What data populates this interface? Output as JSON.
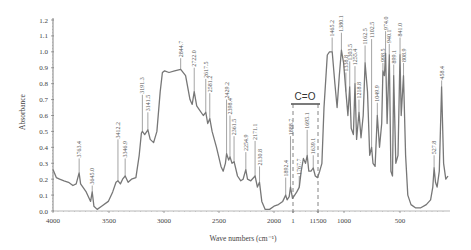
{
  "chart_data": {
    "type": "line",
    "title": "",
    "xlabel": "Wave numbers (cm⁻¹)",
    "ylabel": "Absorbance",
    "xlim": [
      4000,
      400
    ],
    "ylim": [
      0.0,
      1.2
    ],
    "grid": false,
    "legend": null,
    "x_tick_labels": [
      "4000",
      "3500",
      "3000",
      "2500",
      "2000",
      "1",
      "11500",
      "1000",
      "500"
    ],
    "y_tick_labels": [
      "0.0",
      "0.1",
      "0.2",
      "0.3",
      "0.4",
      "0.5",
      "0.6",
      "0.7",
      "0.8",
      "0.9",
      "1.0",
      "1.1",
      "1.2"
    ],
    "annotation": {
      "text": "C=O",
      "range": [
        1888.7,
        1560
      ],
      "style": "dashed bracket"
    },
    "series": [
      {
        "name": "Absorbance spectrum",
        "color": "#777777",
        "points": [
          [
            4000,
            0.26
          ],
          [
            3970,
            0.21
          ],
          [
            3940,
            0.2
          ],
          [
            3900,
            0.19
          ],
          [
            3860,
            0.18
          ],
          [
            3820,
            0.16
          ],
          [
            3790,
            0.17
          ],
          [
            3763.4,
            0.24
          ],
          [
            3750,
            0.17
          ],
          [
            3700,
            0.12
          ],
          [
            3660,
            0.06
          ],
          [
            3645.0,
            0.12
          ],
          [
            3630,
            0.03
          ],
          [
            3600,
            0.01
          ],
          [
            3560,
            0.03
          ],
          [
            3500,
            0.06
          ],
          [
            3460,
            0.12
          ],
          [
            3430,
            0.18
          ],
          [
            3412.2,
            0.19
          ],
          [
            3390,
            0.17
          ],
          [
            3370,
            0.2
          ],
          [
            3346.9,
            0.22
          ],
          [
            3320,
            0.18
          ],
          [
            3290,
            0.2
          ],
          [
            3250,
            0.21
          ],
          [
            3220,
            0.35
          ],
          [
            3200,
            0.49
          ],
          [
            3191.3,
            0.5
          ],
          [
            3170,
            0.48
          ],
          [
            3141.5,
            0.51
          ],
          [
            3120,
            0.45
          ],
          [
            3090,
            0.43
          ],
          [
            3060,
            0.5
          ],
          [
            3030,
            0.75
          ],
          [
            3010,
            0.87
          ],
          [
            2990,
            0.88
          ],
          [
            2950,
            0.87
          ],
          [
            2900,
            0.88
          ],
          [
            2844.7,
            0.89
          ],
          [
            2800,
            0.85
          ],
          [
            2760,
            0.7
          ],
          [
            2740,
            0.67
          ],
          [
            2722.0,
            0.75
          ],
          [
            2700,
            0.66
          ],
          [
            2680,
            0.64
          ],
          [
            2640,
            0.6
          ],
          [
            2617.5,
            0.62
          ],
          [
            2600,
            0.55
          ],
          [
            2581.2,
            0.58
          ],
          [
            2560,
            0.5
          ],
          [
            2520,
            0.4
          ],
          [
            2480,
            0.28
          ],
          [
            2460,
            0.25
          ],
          [
            2440,
            0.3
          ],
          [
            2429.2,
            0.36
          ],
          [
            2410,
            0.32
          ],
          [
            2398.4,
            0.34
          ],
          [
            2380,
            0.3
          ],
          [
            2361.5,
            0.31
          ],
          [
            2330,
            0.22
          ],
          [
            2300,
            0.19
          ],
          [
            2280,
            0.2
          ],
          [
            2254.9,
            0.26
          ],
          [
            2240,
            0.2
          ],
          [
            2210,
            0.19
          ],
          [
            2171.1,
            0.22
          ],
          [
            2150,
            0.15
          ],
          [
            2130.8,
            0.18
          ],
          [
            2110,
            0.06
          ],
          [
            2080,
            0.01
          ],
          [
            2040,
            0.01
          ],
          [
            2000,
            0.03
          ],
          [
            1960,
            0.04
          ],
          [
            1920,
            0.06
          ],
          [
            1892.4,
            0.1
          ],
          [
            1880,
            0.07
          ],
          [
            1860,
            0.09
          ],
          [
            1848.3,
            0.15
          ],
          [
            1830,
            0.08
          ],
          [
            1810,
            0.1
          ],
          [
            1790,
            0.12
          ],
          [
            1767.7,
            0.15
          ],
          [
            1750,
            0.25
          ],
          [
            1730,
            0.33
          ],
          [
            1710,
            0.3
          ],
          [
            1695.1,
            0.35
          ],
          [
            1680,
            0.25
          ],
          [
            1660,
            0.25
          ],
          [
            1639.1,
            0.27
          ],
          [
            1620,
            0.22
          ],
          [
            1600,
            0.21
          ],
          [
            1580,
            0.25
          ],
          [
            1560,
            0.3
          ],
          [
            1540,
            0.65
          ],
          [
            1510,
            0.98
          ],
          [
            1490,
            1.0
          ],
          [
            1465.2,
            1.0
          ],
          [
            1440,
            0.8
          ],
          [
            1420,
            0.65
          ],
          [
            1400,
            0.85
          ],
          [
            1380.1,
            1.01
          ],
          [
            1360,
            0.93
          ],
          [
            1338.8,
            0.75
          ],
          [
            1320,
            0.6
          ],
          [
            1303.5,
            0.78
          ],
          [
            1290,
            0.52
          ],
          [
            1270,
            0.48
          ],
          [
            1255.4,
            0.8
          ],
          [
            1240,
            0.45
          ],
          [
            1218.8,
            0.62
          ],
          [
            1200,
            0.46
          ],
          [
            1180,
            0.6
          ],
          [
            1162.5,
            0.93
          ],
          [
            1140,
            0.75
          ],
          [
            1120,
            0.35
          ],
          [
            1102.5,
            0.4
          ],
          [
            1090,
            0.3
          ],
          [
            1070,
            0.28
          ],
          [
            1049.9,
            0.6
          ],
          [
            1030,
            0.4
          ],
          [
            1010,
            0.55
          ],
          [
            998.5,
            0.88
          ],
          [
            985,
            0.85
          ],
          [
            974.0,
            0.99
          ],
          [
            960,
            0.55
          ],
          [
            940.1,
            0.98
          ],
          [
            925,
            0.25
          ],
          [
            910,
            0.22
          ],
          [
            899.1,
            0.85
          ],
          [
            880,
            0.3
          ],
          [
            860,
            0.35
          ],
          [
            841.0,
            0.98
          ],
          [
            830,
            0.6
          ],
          [
            808.9,
            0.85
          ],
          [
            790,
            0.35
          ],
          [
            770,
            0.1
          ],
          [
            740,
            0.04
          ],
          [
            700,
            0.02
          ],
          [
            650,
            0.02
          ],
          [
            600,
            0.04
          ],
          [
            560,
            0.07
          ],
          [
            540,
            0.15
          ],
          [
            527.8,
            0.27
          ],
          [
            515,
            0.18
          ],
          [
            500,
            0.15
          ],
          [
            480,
            0.25
          ],
          [
            458.4,
            0.78
          ],
          [
            440,
            0.3
          ],
          [
            420,
            0.2
          ],
          [
            400,
            0.22
          ]
        ]
      }
    ],
    "peak_labels": [
      "3763.4",
      "3645.0",
      "3412.2",
      "3346.9",
      "3191.3",
      "3141.5",
      "2844.7",
      "2722.0",
      "2617.5",
      "2581.2",
      "2429.2",
      "2398.4",
      "2361.5",
      "2254.9",
      "2171.1",
      "2130.8",
      "1892.4",
      "1888.7",
      "1767.7",
      "1695.1",
      "1639.1",
      "1465.2",
      "1380.1",
      "1338.8",
      "1303.5",
      "1255.4",
      "1218.8",
      "1162.5",
      "1102.5",
      "1049.9",
      "998.5",
      "974.0",
      "940.1",
      "899.1",
      "841.0",
      "808.9",
      "527.8",
      "458.4"
    ]
  },
  "peaks": [
    {
      "label": "3763.4",
      "wn": 3763.4,
      "tip": 0.24,
      "top": 0.33
    },
    {
      "label": "3645.0",
      "wn": 3645.0,
      "tip": 0.12,
      "top": 0.16
    },
    {
      "label": "3412.2",
      "wn": 3412.2,
      "tip": 0.19,
      "top": 0.45
    },
    {
      "label": "3346.9",
      "wn": 3346.9,
      "tip": 0.22,
      "top": 0.33
    },
    {
      "label": "3191.3",
      "wn": 3191.3,
      "tip": 0.5,
      "top": 0.73
    },
    {
      "label": "3141.5",
      "wn": 3141.5,
      "tip": 0.51,
      "top": 0.62
    },
    {
      "label": "2844.7",
      "wn": 2844.7,
      "tip": 0.89,
      "top": 0.96
    },
    {
      "label": "2722.0",
      "wn": 2722.0,
      "tip": 0.75,
      "top": 0.9
    },
    {
      "label": "2617.5",
      "wn": 2617.5,
      "tip": 0.62,
      "top": 0.83
    },
    {
      "label": "2581.2",
      "wn": 2581.2,
      "tip": 0.58,
      "top": 0.74
    },
    {
      "label": "2429.2",
      "wn": 2429.2,
      "tip": 0.36,
      "top": 0.7
    },
    {
      "label": "2398.4",
      "wn": 2398.4,
      "tip": 0.34,
      "top": 0.6
    },
    {
      "label": "2361.5",
      "wn": 2361.5,
      "tip": 0.31,
      "top": 0.47
    },
    {
      "label": "2254.9",
      "wn": 2254.9,
      "tip": 0.26,
      "top": 0.37
    },
    {
      "label": "2171.1",
      "wn": 2171.1,
      "tip": 0.22,
      "top": 0.44
    },
    {
      "label": "2130.8",
      "wn": 2130.8,
      "tip": 0.18,
      "top": 0.28
    },
    {
      "label": "1892.4",
      "wn": 1892.4,
      "tip": 0.1,
      "top": 0.21
    },
    {
      "label": "1888.7",
      "wn": 1848.3,
      "tip": 0.15,
      "top": 0.47
    },
    {
      "label": "1767.7",
      "wn": 1767.7,
      "tip": 0.15,
      "top": 0.22
    },
    {
      "label": "1695.1",
      "wn": 1695.1,
      "tip": 0.35,
      "top": 0.51
    },
    {
      "label": "1639.1",
      "wn": 1639.1,
      "tip": 0.27,
      "top": 0.35
    },
    {
      "label": "1465.2",
      "wn": 1465.2,
      "tip": 1.0,
      "top": 1.09
    },
    {
      "label": "1380.1",
      "wn": 1380.1,
      "tip": 1.01,
      "top": 1.12
    },
    {
      "label": "1338.8",
      "wn": 1338.8,
      "tip": 0.75,
      "top": 0.87
    },
    {
      "label": "1303.5",
      "wn": 1303.5,
      "tip": 0.78,
      "top": 0.94
    },
    {
      "label": "1255.4",
      "wn": 1255.4,
      "tip": 0.8,
      "top": 0.91
    },
    {
      "label": "1218.8",
      "wn": 1218.8,
      "tip": 0.62,
      "top": 0.7
    },
    {
      "label": "1162.5",
      "wn": 1162.5,
      "tip": 0.93,
      "top": 1.04
    },
    {
      "label": "1102.5",
      "wn": 1102.5,
      "tip": 0.4,
      "top": 1.08
    },
    {
      "label": "1049.9",
      "wn": 1049.9,
      "tip": 0.6,
      "top": 0.68
    },
    {
      "label": "998.5",
      "wn": 998.5,
      "tip": 0.88,
      "top": 0.93
    },
    {
      "label": "974.0",
      "wn": 974.0,
      "tip": 0.99,
      "top": 1.13
    },
    {
      "label": "940.1",
      "wn": 940.1,
      "tip": 0.98,
      "top": 1.05
    },
    {
      "label": "899.1",
      "wn": 899.1,
      "tip": 0.85,
      "top": 0.92
    },
    {
      "label": "841.0",
      "wn": 841.0,
      "tip": 0.98,
      "top": 1.09
    },
    {
      "label": "808.9",
      "wn": 808.9,
      "tip": 0.85,
      "top": 0.93
    },
    {
      "label": "527.8",
      "wn": 527.8,
      "tip": 0.27,
      "top": 0.35
    },
    {
      "label": "458.4",
      "wn": 458.4,
      "tip": 0.78,
      "top": 0.82
    }
  ],
  "axes": {
    "ylabel": "Absorbance",
    "xlabel": "Wave numbers (cm⁻¹)",
    "co_label": "C=O"
  },
  "style": {
    "line_color": "#777777",
    "axis_color": "#666666",
    "text_color": "#444444"
  }
}
